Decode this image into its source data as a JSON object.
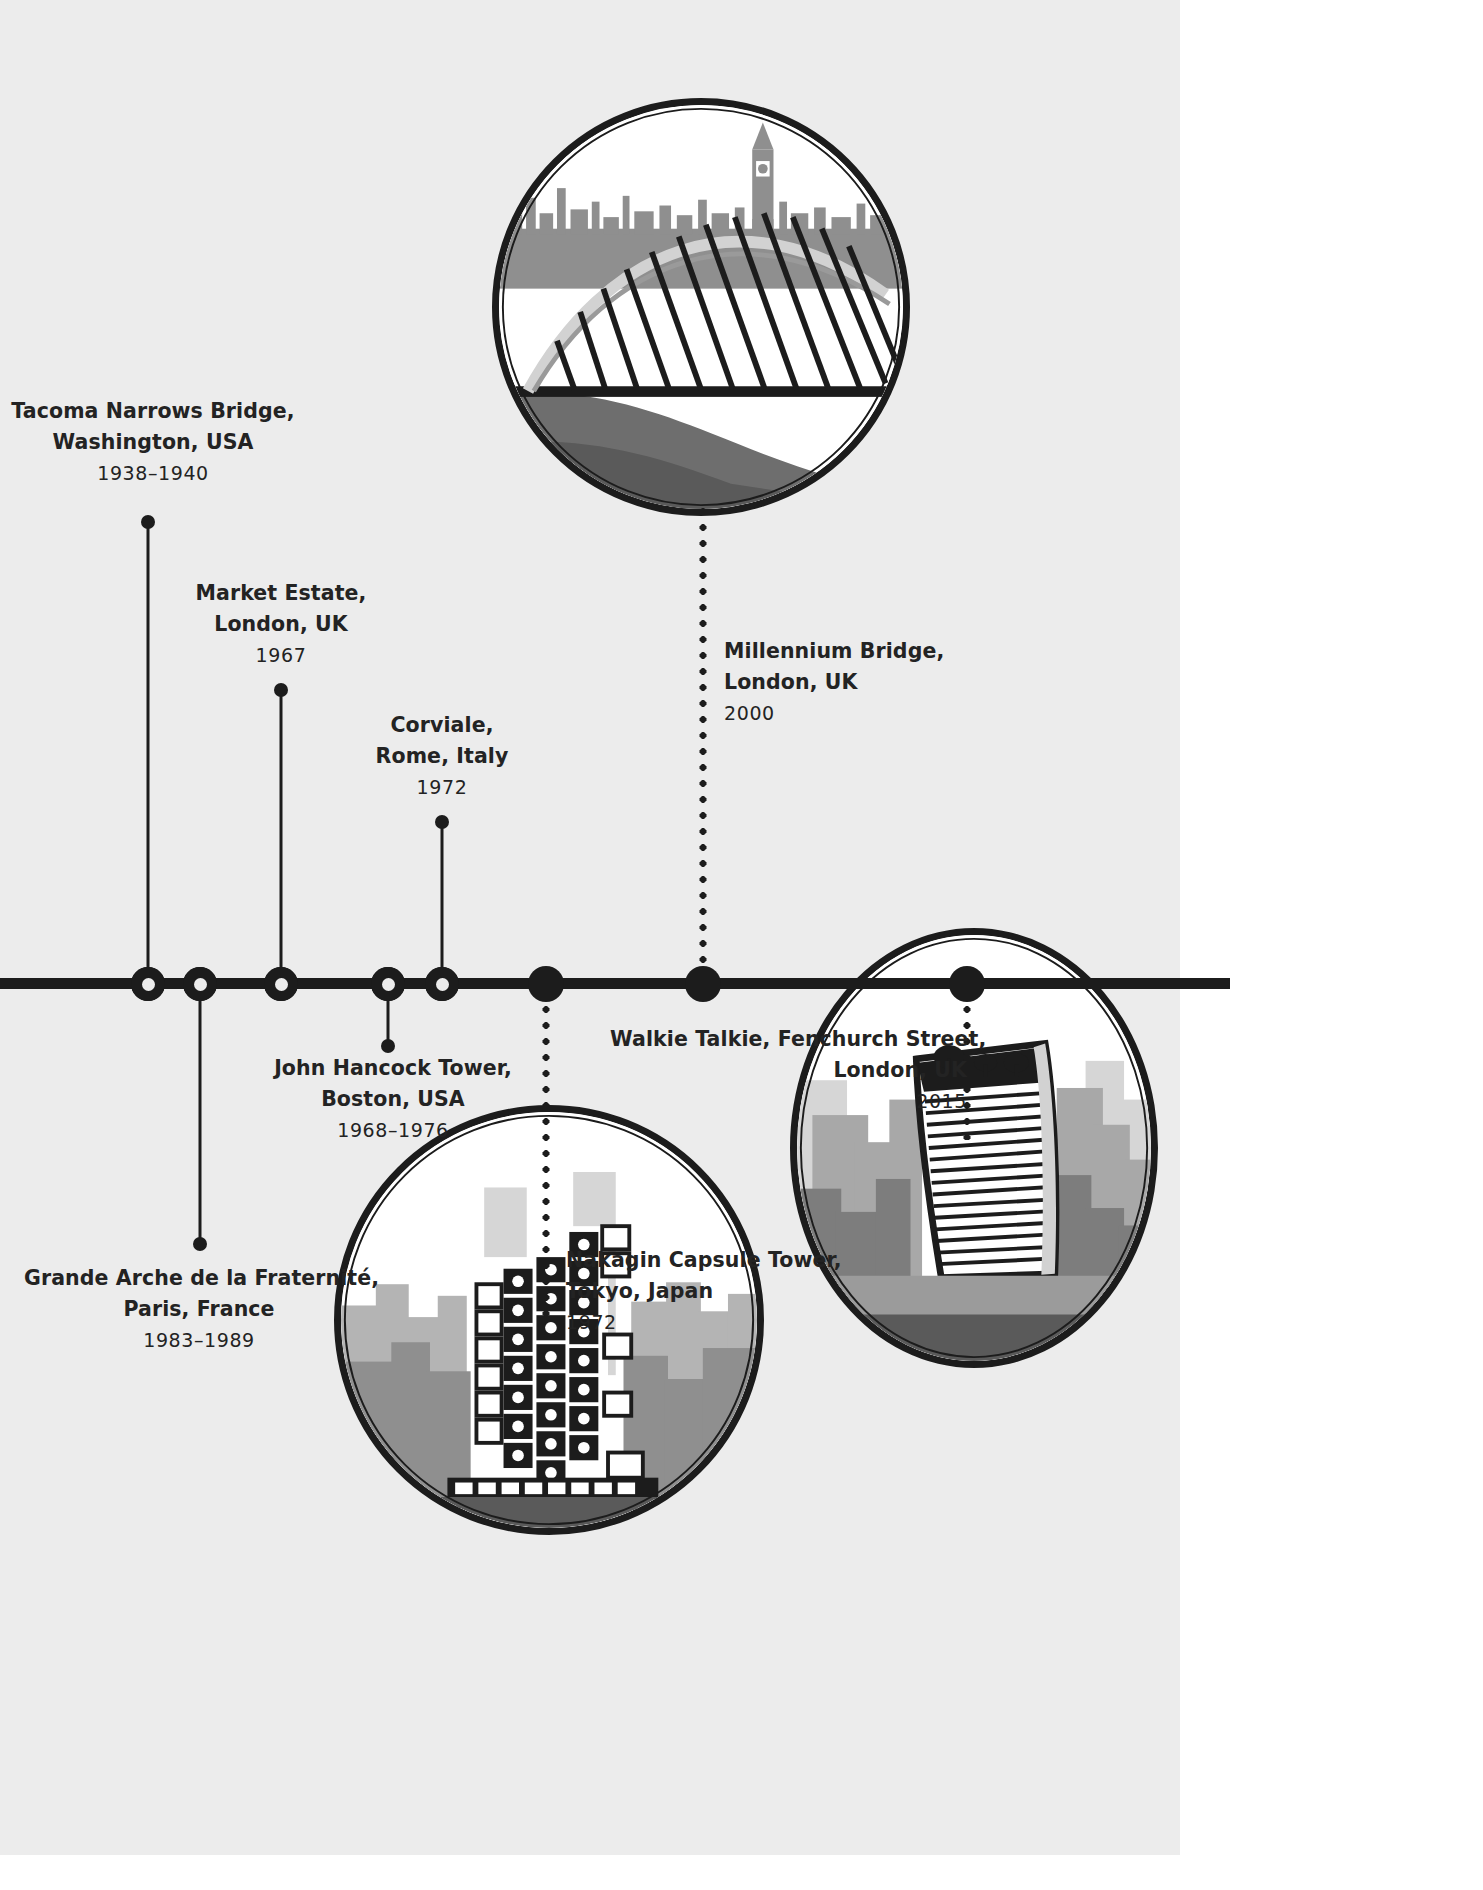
{
  "figure": {
    "type": "timeline",
    "orientation": "horizontal",
    "background_color": "#ececec",
    "accent_color": "#1c1c1c",
    "text_color": "#232323"
  },
  "entries": [
    {
      "id": "tacoma-narrows-bridge",
      "name_line1": "Tacoma Narrows Bridge,",
      "name_line2": "Washington, USA",
      "year": "1938–1940",
      "marker_style": "hollow",
      "connector": "solid",
      "label_side": "above",
      "label_align": "center",
      "has_photo": false
    },
    {
      "id": "market-estate",
      "name_line1": "Market Estate,",
      "name_line2": "London, UK",
      "year": "1967",
      "marker_style": "hollow",
      "connector": "solid",
      "label_side": "above",
      "label_align": "center",
      "has_photo": false
    },
    {
      "id": "corviale",
      "name_line1": "Corviale,",
      "name_line2": "Rome, Italy",
      "year": "1972",
      "marker_style": "hollow",
      "connector": "solid",
      "label_side": "above",
      "label_align": "center",
      "has_photo": false
    },
    {
      "id": "millennium-bridge",
      "name_line1": "Millennium Bridge,",
      "name_line2": "London, UK",
      "year": "2000",
      "marker_style": "solid",
      "connector": "dotted",
      "label_side": "above",
      "label_align": "left",
      "has_photo": true,
      "photo_alt": "millennium-bridge-illustration"
    },
    {
      "id": "john-hancock-tower",
      "name_line1": "John Hancock Tower,",
      "name_line2": "Boston, USA",
      "year": "1968–1976",
      "marker_style": "hollow",
      "connector": "solid",
      "label_side": "below",
      "label_align": "center",
      "has_photo": false
    },
    {
      "id": "grande-arche-de-la-fraternite",
      "name_line1": "Grande Arche de la Fraternité,",
      "name_line2": "Paris, France",
      "year": "1983–1989",
      "marker_style": "hollow",
      "connector": "solid",
      "label_side": "below",
      "label_align": "center",
      "has_photo": false
    },
    {
      "id": "nakagin-capsule-tower",
      "name_line1": "Nakagin Capsule Tower,",
      "name_line2": "Tokyo, Japan",
      "year": "1972",
      "marker_style": "solid",
      "connector": "dotted",
      "label_side": "below",
      "label_align": "left",
      "has_photo": true,
      "photo_alt": "nakagin-capsule-tower-illustration"
    },
    {
      "id": "walkie-talkie",
      "name_line1": "Walkie Talkie, Fenchurch Street,",
      "name_line2": "London, UK",
      "year": "2015",
      "marker_style": "solid",
      "connector": "dotted",
      "label_side": "below",
      "label_align": "right",
      "has_photo": true,
      "photo_alt": "walkie-talkie-tower-illustration"
    }
  ]
}
